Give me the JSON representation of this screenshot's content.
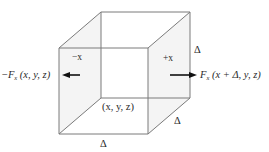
{
  "diagram": {
    "type": "cube control volume with flux in x-direction",
    "colors": {
      "edge": "#7a7a7a",
      "arrow": "#111111",
      "text": "#2a2a2a",
      "background": "#ffffff"
    },
    "vertices": {
      "front_top_left": [
        59,
        48
      ],
      "front_top_right": [
        148,
        48
      ],
      "front_bottom_left": [
        59,
        134
      ],
      "front_bottom_right": [
        148,
        134
      ],
      "back_top_left": [
        101,
        12
      ],
      "back_top_right": [
        190,
        12
      ],
      "back_bottom_left": [
        101,
        98
      ],
      "back_bottom_right": [
        190,
        98
      ]
    },
    "labels": {
      "minus_x_face": "−x",
      "plus_x_face": "+x",
      "corner_point": "(x, y, z)",
      "delta_height": "Δ",
      "delta_depth": "Δ",
      "delta_width": "Δ"
    },
    "flux_left": {
      "sign": "−",
      "symbol": "F",
      "subscript": "x",
      "args": "(x, y, z)",
      "arrow_direction": "left"
    },
    "flux_right": {
      "symbol": "F",
      "subscript": "x",
      "args": "(x + Δ, y, z)",
      "arrow_direction": "right"
    }
  }
}
